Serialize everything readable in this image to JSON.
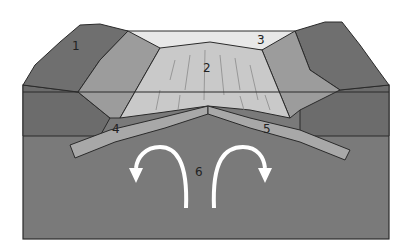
{
  "diagram": {
    "type": "cross-section",
    "labels": [
      {
        "id": "1",
        "text": "1",
        "x": 75,
        "y": 50
      },
      {
        "id": "2",
        "text": "2",
        "x": 208,
        "y": 72
      },
      {
        "id": "3",
        "text": "3",
        "x": 261,
        "y": 44
      },
      {
        "id": "4",
        "text": "4",
        "x": 116,
        "y": 133
      },
      {
        "id": "5",
        "text": "5",
        "x": 267,
        "y": 133
      },
      {
        "id": "6",
        "text": "6",
        "x": 198,
        "y": 176
      }
    ],
    "colors": {
      "background": "#ffffff",
      "mantle": "#7a7a7a",
      "mountains": "#6f6f6f",
      "slope": "#9a9a9a",
      "ridge": "#c8c8c8",
      "top_surface": "#e6e6e6",
      "plates": "#a6a6a6",
      "arrows": "#ffffff",
      "outline": "#2a2a2a"
    }
  }
}
